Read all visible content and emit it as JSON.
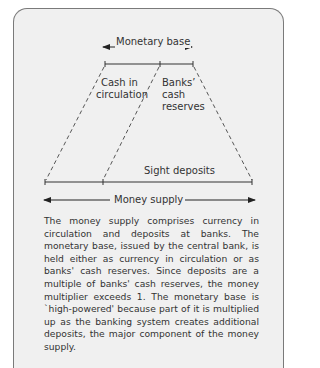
{
  "diagram": {
    "labels": {
      "monetary_base": "Monetary base",
      "cash_in_circulation_1": "Cash in",
      "cash_in_circulation_2": "circulation",
      "banks_cash_reserves_1": "Banks’",
      "banks_cash_reserves_2": "cash",
      "banks_cash_reserves_3": "reserves",
      "sight_deposits": "Sight deposits",
      "money_supply": "Money supply"
    },
    "colors": {
      "background": "#f0f0f0",
      "line": "#333333",
      "border": "#7a7a7a"
    }
  },
  "caption": {
    "text": "The money supply comprises currency in circulation and deposits at banks. The monetary base, issued by the central bank, is held either as currency in circulation or as banks' cash reserves. Since deposits are a multiple of banks' cash reserves, the money multiplier exceeds 1. The monetary base is `high-powered' because part of it is multiplied up as the banking system creates additional deposits, the major component of the money supply."
  }
}
